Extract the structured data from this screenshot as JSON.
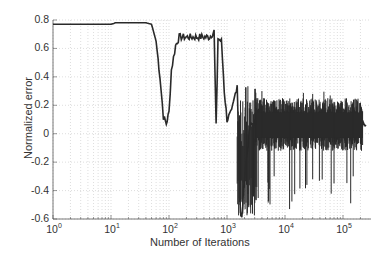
{
  "chart_data": {
    "type": "line",
    "title": "",
    "xlabel": "Number of Iterations",
    "ylabel": "Normalized error",
    "xscale": "log",
    "xlim": [
      1,
      250000
    ],
    "ylim": [
      -0.6,
      0.8
    ],
    "grid": true,
    "grid_style": "dotted",
    "legend": null,
    "x_tick_labels": [
      "10^0",
      "10^1",
      "10^2",
      "10^3",
      "10^4",
      "10^5"
    ],
    "y_tick_labels": [
      "0.8",
      "0.6",
      "0.4",
      "0.2",
      "0",
      "-0.2",
      "-0.4",
      "-0.6"
    ],
    "series": [
      {
        "name": "normalized error",
        "color": "#2a2a2a",
        "x": [
          1,
          5,
          10,
          12,
          20,
          40,
          50,
          60,
          70,
          80,
          90,
          100,
          110,
          130,
          150,
          200,
          300,
          400,
          500,
          600,
          650,
          700,
          800,
          900,
          1000,
          1200,
          1500,
          1700,
          1800,
          2000,
          2500,
          3000,
          5000,
          10000,
          20000,
          50000,
          100000,
          200000,
          250000
        ],
        "values": [
          0.77,
          0.77,
          0.77,
          0.78,
          0.78,
          0.78,
          0.77,
          0.65,
          0.4,
          0.12,
          0.07,
          0.15,
          0.45,
          0.62,
          0.68,
          0.68,
          0.68,
          0.68,
          0.68,
          0.72,
          0.05,
          0.67,
          0.65,
          0.3,
          0.1,
          0.15,
          0.35,
          -0.55,
          -0.6,
          -0.3,
          0.05,
          0.08,
          0.08,
          0.07,
          0.07,
          0.07,
          0.07,
          0.06,
          0.06
        ],
        "noise_band": {
          "x_from": 3000,
          "x_to": 220000,
          "upper": 0.25,
          "lower": -0.12,
          "spike_min": -0.53
        }
      }
    ]
  }
}
